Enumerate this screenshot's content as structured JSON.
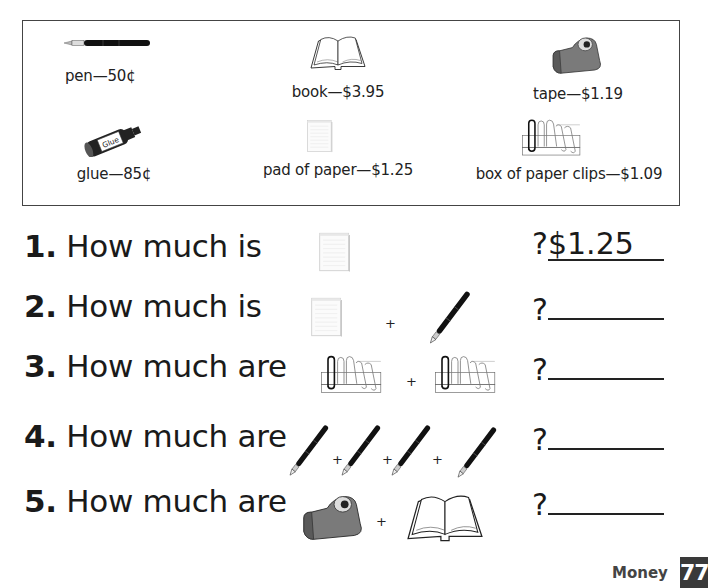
{
  "price_list": {
    "items": [
      {
        "name": "pen",
        "label": "pen—50¢",
        "icon": "pen-icon"
      },
      {
        "name": "book",
        "label": "book—$3.95",
        "icon": "book-icon"
      },
      {
        "name": "tape",
        "label": "tape—$1.19",
        "icon": "tape-dispenser-icon"
      },
      {
        "name": "glue",
        "label": "glue—85¢",
        "icon": "glue-icon",
        "icon_text": "Glue"
      },
      {
        "name": "pad of paper",
        "label": "pad of paper—$1.25",
        "icon": "notepad-icon"
      },
      {
        "name": "box of paper clips",
        "label": "box of paper clips—$1.09",
        "icon": "paper-clips-icon"
      }
    ]
  },
  "questions": [
    {
      "number": "1.",
      "text": " How much is",
      "items": [
        "pad of paper"
      ],
      "answer_prefix": "?",
      "answer": "$1.25"
    },
    {
      "number": "2.",
      "text": " How much is",
      "items": [
        "pad of paper",
        "pen"
      ],
      "answer_prefix": "?",
      "answer": ""
    },
    {
      "number": "3.",
      "text": " How much are",
      "items": [
        "box of paper clips",
        "box of paper clips"
      ],
      "answer_prefix": "?",
      "answer": ""
    },
    {
      "number": "4.",
      "text": " How much are",
      "items": [
        "pen",
        "pen",
        "pen",
        "pen"
      ],
      "answer_prefix": "?",
      "answer": ""
    },
    {
      "number": "5.",
      "text": " How much are",
      "items": [
        "tape",
        "book"
      ],
      "answer_prefix": "?",
      "answer": ""
    }
  ],
  "operator": "+",
  "footer": {
    "section": "Money",
    "page_number": "77"
  }
}
